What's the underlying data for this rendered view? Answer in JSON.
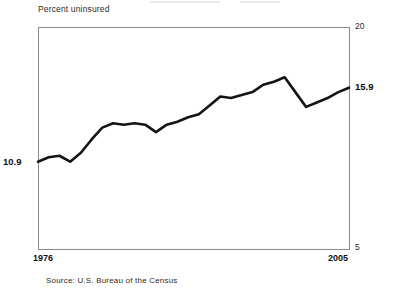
{
  "chart": {
    "axis_title": "Percent uninsured",
    "source": "Source: U.S. Bureau of the Census",
    "y_top_tick": "20",
    "y_bottom_tick": "5",
    "x_start_tick": "1976",
    "x_end_tick": "2005",
    "start_value_label": "10.9",
    "end_value_label": "15.9",
    "line_color": "#141414",
    "frame_color": "#8a8a8a"
  },
  "chart_data": {
    "type": "line",
    "title": "",
    "subtitle": "",
    "xlabel": "",
    "ylabel": "Percent uninsured",
    "xlim": [
      1976,
      2005
    ],
    "ylim": [
      5,
      20
    ],
    "grid": false,
    "legend": "none",
    "annotations": [
      {
        "text": "10.9",
        "x": 1976,
        "y": 10.9,
        "position": "left"
      },
      {
        "text": "15.9",
        "x": 2005,
        "y": 15.9,
        "position": "right"
      }
    ],
    "x": [
      1976,
      1977,
      1978,
      1979,
      1980,
      1981,
      1982,
      1983,
      1984,
      1985,
      1986,
      1987,
      1988,
      1989,
      1990,
      1991,
      1992,
      1993,
      1994,
      1995,
      1996,
      1997,
      1998,
      1999,
      2000,
      2001,
      2002,
      2003,
      2004,
      2005
    ],
    "series": [
      {
        "name": "Percent uninsured",
        "values": [
          10.9,
          11.2,
          11.3,
          10.9,
          11.5,
          12.4,
          13.2,
          13.5,
          13.4,
          13.5,
          13.4,
          12.9,
          13.4,
          13.6,
          13.9,
          14.1,
          14.7,
          15.3,
          15.2,
          15.4,
          15.6,
          16.1,
          16.3,
          16.6,
          15.6,
          14.6,
          14.9,
          15.2,
          15.6,
          15.9
        ]
      }
    ]
  },
  "plot_geometry": {
    "frame_left": 38,
    "frame_top": 27,
    "frame_right": 349,
    "frame_bottom": 249,
    "note": "pixel box of the plotted axes rectangle"
  }
}
